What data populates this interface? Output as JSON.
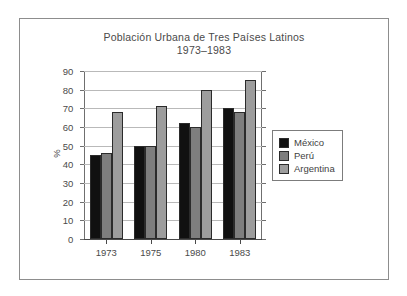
{
  "chart_data": {
    "type": "bar",
    "title": "Población Urbana de Tres Países Latinos",
    "subtitle": "1973–1983",
    "xlabel": "",
    "ylabel": "%",
    "categories": [
      "1973",
      "1975",
      "1980",
      "1983"
    ],
    "series": [
      {
        "name": "México",
        "color": "#111111",
        "values": [
          45,
          50,
          62,
          70
        ]
      },
      {
        "name": "Perú",
        "color": "#7e7e7e",
        "values": [
          46,
          50,
          60,
          68
        ]
      },
      {
        "name": "Argentina",
        "color": "#9d9d9d",
        "values": [
          68,
          71,
          80,
          85
        ]
      }
    ],
    "ylim": [
      0,
      90
    ],
    "ytick_step": 10,
    "yticks": [
      "0",
      "10",
      "20",
      "30",
      "40",
      "50",
      "60",
      "70",
      "80",
      "90"
    ],
    "grid": true,
    "legend_position": "right"
  },
  "legend": {
    "items": [
      {
        "label": "México"
      },
      {
        "label": "Perú"
      },
      {
        "label": "Argentina"
      }
    ]
  }
}
